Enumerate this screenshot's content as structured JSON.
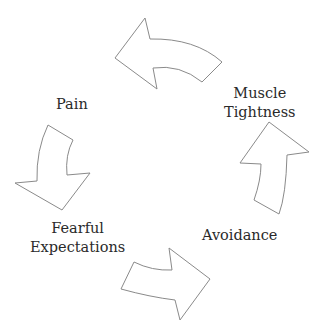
{
  "diagram": {
    "type": "cycle",
    "stroke_color": "#8a8a8a",
    "fill_color": "#ffffff",
    "nodes": [
      {
        "id": "muscle",
        "line1": "Muscle",
        "line2": "Tightness"
      },
      {
        "id": "pain",
        "line1": "Pain"
      },
      {
        "id": "fear",
        "line1": "Fearful",
        "line2": "Expectations"
      },
      {
        "id": "avoid",
        "line1": "Avoidance"
      }
    ],
    "edges": [
      {
        "from": "Muscle Tightness",
        "to": "Pain"
      },
      {
        "from": "Pain",
        "to": "Fearful Expectations"
      },
      {
        "from": "Fearful Expectations",
        "to": "Avoidance"
      },
      {
        "from": "Avoidance",
        "to": "Muscle Tightness"
      }
    ]
  }
}
